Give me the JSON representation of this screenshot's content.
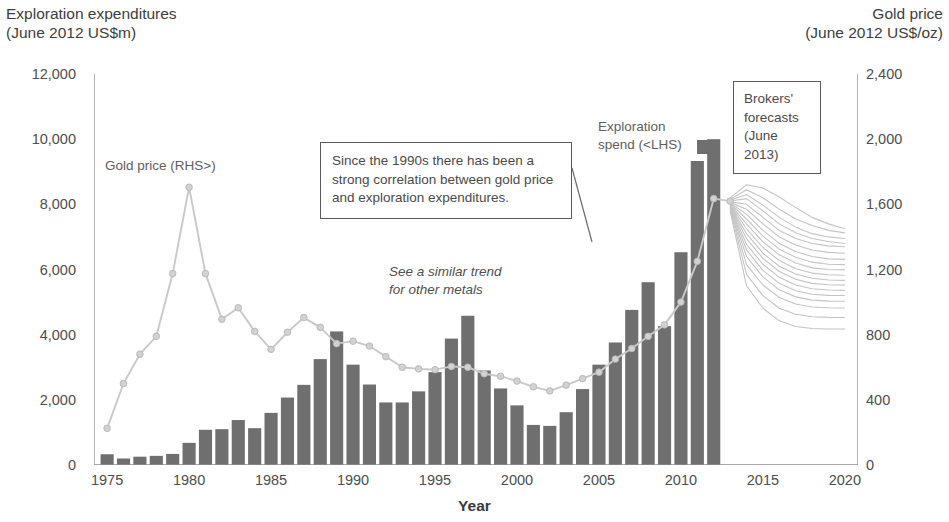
{
  "titles": {
    "left_axis": "Exploration expenditures\n(June 2012 US$m)",
    "right_axis": "Gold price\n(June 2012 US$/oz)",
    "x_axis": "Year"
  },
  "annotations": {
    "gold_price_series": "Gold price (RHS>)",
    "exploration_spend_series": "Exploration\nspend (<LHS)",
    "similar_trend": "See a similar trend\nfor other metals",
    "correlation_callout": "Since the 1990s there has been a strong correlation between gold price and exploration expenditures.",
    "brokers_callout": "Brokers'\nforecasts\n(June 2013)"
  },
  "axis_labels": {
    "left": [
      "12,000",
      "10,000",
      "8,000",
      "6,000",
      "4,000",
      "2,000",
      "0"
    ],
    "right": [
      "2,400",
      "2,000",
      "1,600",
      "1,200",
      "800",
      "400",
      "0"
    ],
    "x": [
      "1975",
      "1980",
      "1985",
      "1990",
      "1995",
      "2000",
      "2005",
      "2010",
      "2015",
      "2020"
    ]
  },
  "colors": {
    "bar": "#6f6f6f",
    "line": "#c9c9c9",
    "marker": "#d2d2d2",
    "forecast": "#c4c4c4",
    "axis": "#8d8d8d",
    "text": "#4a4a4a"
  },
  "chart_data": {
    "type": "bar",
    "xlabel": "Year",
    "ylabel": "Exploration expenditures (June 2012 US$m)",
    "y2label": "Gold price (June 2012 US$/oz)",
    "ylim": [
      0,
      12000
    ],
    "y2lim": [
      0,
      2400
    ],
    "xlim": [
      1974.2,
      2020.8
    ],
    "grid": false,
    "legend": "inline annotations",
    "yticks": [
      0,
      2000,
      4000,
      6000,
      8000,
      10000,
      12000
    ],
    "y2ticks": [
      0,
      400,
      800,
      1200,
      1600,
      2000,
      2400
    ],
    "xticks": [
      1975,
      1980,
      1985,
      1990,
      1995,
      2000,
      2005,
      2010,
      2015,
      2020
    ],
    "series": [
      {
        "name": "Exploration spend (<LHS)",
        "type": "bar",
        "axis": "left",
        "units": "June 2012 US$m",
        "x": [
          1975,
          1976,
          1977,
          1978,
          1979,
          1980,
          1981,
          1982,
          1983,
          1984,
          1985,
          1986,
          1987,
          1988,
          1989,
          1990,
          1991,
          1992,
          1993,
          1994,
          1995,
          1996,
          1997,
          1998,
          1999,
          2000,
          2001,
          2002,
          2003,
          2004,
          2005,
          2006,
          2007,
          2008,
          2009,
          2010,
          2011,
          2012
        ],
        "values": [
          330,
          200,
          255,
          280,
          340,
          680,
          1080,
          1100,
          1380,
          1130,
          1600,
          2070,
          2460,
          3250,
          4100,
          3080,
          2470,
          1920,
          1920,
          2260,
          2850,
          3880,
          4580,
          2900,
          2350,
          1830,
          1230,
          1200,
          1620,
          2330,
          3080,
          3760,
          4760,
          5610,
          4260,
          6530,
          9330,
          10000
        ]
      },
      {
        "name": "Gold price (RHS>)",
        "type": "line",
        "axis": "right",
        "units": "June 2012 US$/oz",
        "x": [
          1975,
          1976,
          1977,
          1978,
          1979,
          1980,
          1981,
          1982,
          1983,
          1984,
          1985,
          1986,
          1987,
          1988,
          1989,
          1990,
          1991,
          1992,
          1993,
          1994,
          1995,
          1996,
          1997,
          1998,
          1999,
          2000,
          2001,
          2002,
          2003,
          2004,
          2005,
          2006,
          2007,
          2008,
          2009,
          2010,
          2011,
          2012,
          2013
        ],
        "values": [
          225,
          500,
          680,
          790,
          1175,
          1705,
          1175,
          895,
          965,
          820,
          710,
          815,
          905,
          845,
          745,
          760,
          730,
          665,
          600,
          590,
          585,
          605,
          600,
          560,
          545,
          515,
          480,
          455,
          490,
          530,
          570,
          650,
          715,
          790,
          860,
          1000,
          1250,
          1635,
          1620
        ]
      },
      {
        "name": "Brokers' forecasts (June 2013)",
        "type": "line-bundle",
        "axis": "right",
        "units": "June 2012 US$/oz",
        "count": 18,
        "x_start": 2013,
        "x_end": 2020,
        "start_value": 1620,
        "end_value_range": [
          770,
          1445
        ],
        "forecast_paths": [
          [
            1640,
            1720,
            1700,
            1645,
            1580,
            1520,
            1480,
            1450
          ],
          [
            1630,
            1690,
            1640,
            1570,
            1510,
            1470,
            1440,
            1425
          ],
          [
            1625,
            1660,
            1595,
            1520,
            1460,
            1420,
            1400,
            1390
          ],
          [
            1620,
            1635,
            1560,
            1480,
            1425,
            1390,
            1372,
            1360
          ],
          [
            1615,
            1600,
            1520,
            1440,
            1390,
            1360,
            1345,
            1340
          ],
          [
            1612,
            1570,
            1480,
            1400,
            1350,
            1320,
            1305,
            1300
          ],
          [
            1608,
            1540,
            1440,
            1360,
            1310,
            1280,
            1265,
            1262
          ],
          [
            1605,
            1510,
            1405,
            1325,
            1275,
            1245,
            1232,
            1230
          ],
          [
            1600,
            1480,
            1370,
            1290,
            1240,
            1210,
            1200,
            1198
          ],
          [
            1598,
            1450,
            1335,
            1255,
            1205,
            1178,
            1168,
            1165
          ],
          [
            1595,
            1420,
            1300,
            1220,
            1172,
            1146,
            1136,
            1133
          ],
          [
            1592,
            1390,
            1268,
            1188,
            1140,
            1115,
            1106,
            1104
          ],
          [
            1590,
            1355,
            1232,
            1152,
            1105,
            1082,
            1074,
            1072
          ],
          [
            1585,
            1320,
            1195,
            1115,
            1070,
            1048,
            1041,
            1040
          ],
          [
            1580,
            1280,
            1155,
            1075,
            1032,
            1012,
            1006,
            1005
          ],
          [
            1575,
            1230,
            1105,
            1028,
            988,
            970,
            965,
            964
          ],
          [
            1570,
            1170,
            1040,
            962,
            925,
            910,
            906,
            905
          ],
          [
            1560,
            1100,
            962,
            885,
            850,
            838,
            835,
            835
          ]
        ]
      }
    ],
    "notes": [
      "Gold price peaks in 1980 at about US$1,700/oz (June 2012 dollars).",
      "Exploration expenditures peak in 2012 at about US$10,000m.",
      "Broker forecast bundle starts June 2013 and fans downward to 2020."
    ]
  }
}
